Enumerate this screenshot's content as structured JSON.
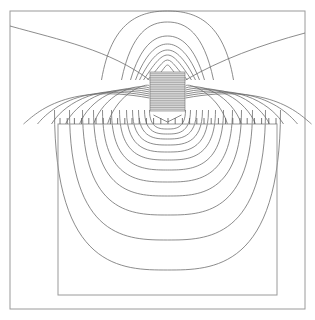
{
  "figure": {
    "outer_frame": {
      "x": 10,
      "y": 11,
      "w": 295,
      "h": 298
    },
    "workpiece": {
      "x": 58,
      "y": 124,
      "w": 219,
      "h": 171
    },
    "coil": {
      "x": 150,
      "y": 72,
      "w": 35,
      "h": 39,
      "turn_lines": 22
    },
    "surface_ticks": {
      "y": 124,
      "x_start": 60,
      "x_end": 276,
      "spacing": 7.2,
      "height": 6
    },
    "center_x": 167.5,
    "colors": {
      "frame": "#9a9a9a",
      "contour": "#6e6e6e",
      "background": "#ffffff"
    }
  },
  "contours": {
    "top_lobes": [
      {
        "w": 112,
        "top": 11,
        "bottom": 72
      },
      {
        "w": 72,
        "top": 22,
        "bottom": 72
      },
      {
        "w": 54,
        "top": 36,
        "bottom": 72
      },
      {
        "w": 44,
        "top": 44,
        "bottom": 72
      },
      {
        "w": 36,
        "top": 50,
        "bottom": 72
      },
      {
        "w": 28,
        "top": 55,
        "bottom": 72
      },
      {
        "w": 20,
        "top": 60,
        "bottom": 72
      },
      {
        "w": 12,
        "top": 65,
        "bottom": 72
      }
    ],
    "bottom_lobes": [
      {
        "w": 226,
        "depth": 270
      },
      {
        "w": 196,
        "depth": 240
      },
      {
        "w": 170,
        "depth": 215
      },
      {
        "w": 148,
        "depth": 196
      },
      {
        "w": 130,
        "depth": 182
      },
      {
        "w": 112,
        "depth": 170
      },
      {
        "w": 96,
        "depth": 160
      },
      {
        "w": 82,
        "depth": 152
      },
      {
        "w": 70,
        "depth": 145
      },
      {
        "w": 58,
        "depth": 139
      },
      {
        "w": 46,
        "depth": 134
      },
      {
        "w": 36,
        "depth": 129
      }
    ]
  }
}
